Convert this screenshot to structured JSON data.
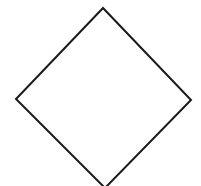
{
  "diagram": {
    "background": "#ffffff",
    "shapes": [
      {
        "type": "diamond",
        "label": "",
        "stroke": "#1a1a1a",
        "fill": "#ffffff",
        "stroke_width": 2,
        "vertices": {
          "top": [
            103,
            8
          ],
          "right": [
            191,
            100
          ],
          "bottom": [
            105,
            188
          ],
          "left": [
            16,
            99
          ]
        }
      }
    ]
  }
}
